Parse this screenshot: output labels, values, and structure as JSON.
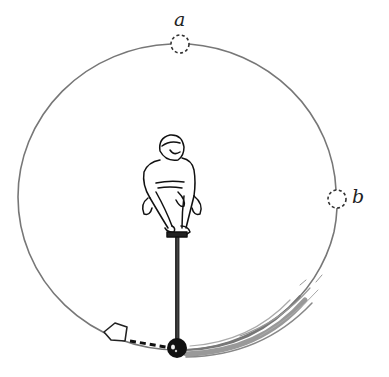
{
  "diagram": {
    "type": "physics-illustration",
    "labels": {
      "a": "a",
      "b": "b"
    },
    "path": {
      "shape": "circle",
      "stroke_color": "#777777"
    },
    "points": [
      {
        "id": "a",
        "position": "top of circle",
        "style": "dashed-circle"
      },
      {
        "id": "b",
        "position": "right side of circle",
        "style": "dashed-circle"
      }
    ],
    "ball": {
      "position": "bottom of circle",
      "color": "#111111"
    },
    "motion": {
      "direction_arrow": "hollow arrow pointing left (tangent at release)",
      "motion_blur": "counter-clockwise swoosh from right side to bottom"
    }
  }
}
